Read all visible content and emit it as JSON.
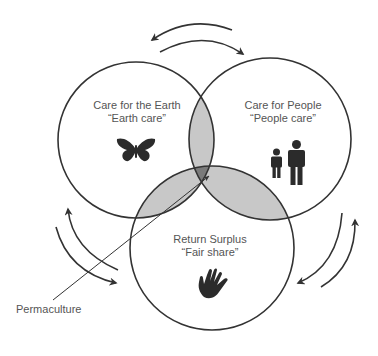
{
  "diagram": {
    "type": "venn",
    "colors": {
      "stroke": "#333333",
      "pair_overlap": "#c8c8c8",
      "center_overlap": "#7a7a7a",
      "text": "#555555",
      "icon": "#2b2b2b"
    },
    "sets": [
      {
        "id": "earth",
        "title": "Care for the Earth",
        "subtitle": "“Earth care”",
        "icon": "butterfly-icon"
      },
      {
        "id": "people",
        "title": "Care for People",
        "subtitle": "“People care”",
        "icon": "people-icon"
      },
      {
        "id": "fair",
        "title": "Return Surplus",
        "subtitle": "“Fair share”",
        "icon": "hand-icon"
      }
    ],
    "center_label": "Permaculture",
    "cycle_arrows": [
      {
        "between": [
          "earth",
          "people"
        ],
        "position": "top"
      },
      {
        "between": [
          "earth",
          "fair"
        ],
        "position": "left"
      },
      {
        "between": [
          "people",
          "fair"
        ],
        "position": "right"
      }
    ]
  }
}
